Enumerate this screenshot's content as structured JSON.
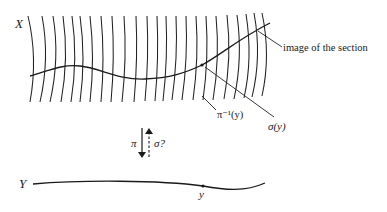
{
  "figure": {
    "total_space_label": "X",
    "base_space_label": "Y",
    "section_label": "image of the section",
    "sigma_y_label": "σ(y)",
    "fiber_label": "π⁻¹(y)",
    "projection_label": "π",
    "section_map_label": "σ?",
    "point_label": "y"
  },
  "colors": {
    "ink": "#1a1a1a",
    "background": "#ffffff"
  }
}
